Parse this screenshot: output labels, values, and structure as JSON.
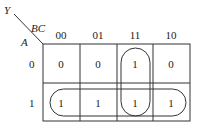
{
  "kmap": {
    "output_var": "Y",
    "col_vars": "BC",
    "row_vars": "A",
    "col_labels": [
      "00",
      "01",
      "11",
      "10"
    ],
    "row_labels": [
      "0",
      "1"
    ],
    "cells": [
      [
        "0",
        "0",
        "1",
        "0"
      ],
      [
        "1",
        "1",
        "1",
        "1"
      ]
    ],
    "groups": [
      {
        "name": "vertical-group-BC11",
        "cells": [
          [
            0,
            2
          ],
          [
            1,
            2
          ]
        ]
      },
      {
        "name": "horizontal-group-A1",
        "cells": [
          [
            1,
            0
          ],
          [
            1,
            1
          ],
          [
            1,
            2
          ],
          [
            1,
            3
          ]
        ]
      }
    ]
  }
}
